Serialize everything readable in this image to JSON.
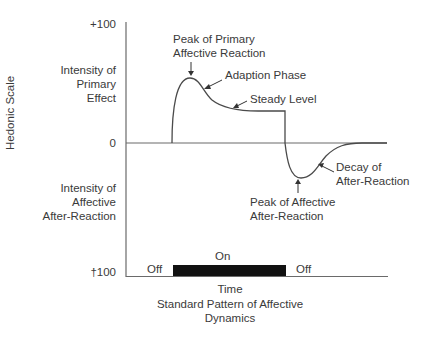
{
  "diagram": {
    "title": "Standard Pattern of Affective Dynamics",
    "title_line1": "Standard Pattern of Affective",
    "title_line2": "Dynamics",
    "y_axis_label": "Hedonic Scale",
    "x_axis_label": "Time",
    "y_ticks": {
      "top": "+100",
      "zero": "0",
      "bottom": "†100"
    },
    "y_region_labels": {
      "positive": [
        "Intensity of",
        "Primary",
        "Effect"
      ],
      "negative": [
        "Intensity of",
        "Affective",
        "After-Reaction"
      ]
    },
    "annotations": {
      "peak_primary": [
        "Peak of Primary",
        "Affective Reaction"
      ],
      "adaption": "Adaption Phase",
      "steady": "Steady Level",
      "decay": [
        "Decay of",
        "After-Reaction"
      ],
      "peak_after": [
        "Peak of Affective",
        "After-Reaction"
      ]
    },
    "stimulus": {
      "off_before": "Off",
      "on": "On",
      "off_after": "Off"
    },
    "colors": {
      "line": "#4a4a4a",
      "bar": "#111111",
      "text": "#3a3a3a"
    }
  }
}
